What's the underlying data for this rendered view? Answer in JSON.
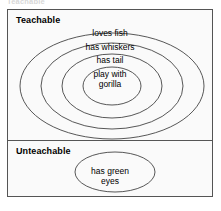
{
  "clipped_caption": "Teachable",
  "diagram": {
    "type": "nested-ellipse-concept-hierarchy",
    "border_color": "#555555",
    "background_color": "#fafafa",
    "text_color": "#000000",
    "sections": [
      {
        "id": "teachable",
        "title": "Teachable",
        "rings": [
          {
            "level": 1,
            "label_lines": [
              "loves fish"
            ]
          },
          {
            "level": 2,
            "label_lines": [
              "has whiskers"
            ]
          },
          {
            "level": 3,
            "label_lines": [
              "has tail"
            ]
          },
          {
            "level": 4,
            "label_lines": [
              "play with",
              "gorilla"
            ]
          }
        ]
      },
      {
        "id": "unteachable",
        "title": "Unteachable",
        "rings": [
          {
            "level": 1,
            "label_lines": [
              "has green",
              "eyes"
            ]
          }
        ]
      }
    ]
  }
}
